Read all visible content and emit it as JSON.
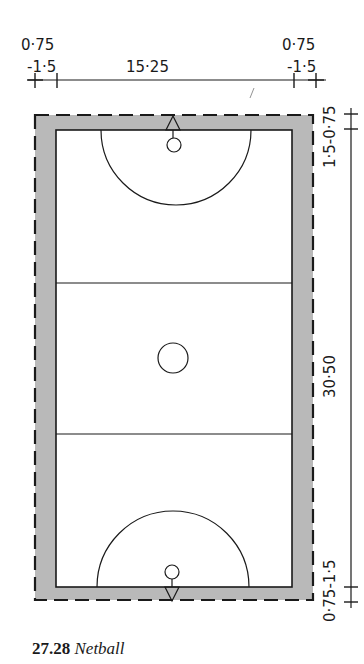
{
  "figure": {
    "number": "27.28",
    "title": "Netball",
    "sport": "Netball court plan"
  },
  "dimensions": {
    "top_left_outer": "0·75",
    "top_left_inner": "-1·5",
    "court_width": "15·25",
    "top_right_outer": "0·75",
    "top_right_inner": "-1·5",
    "end_margin_top": "1·5-0·75",
    "court_length": "30·50",
    "end_margin_bottom": "0·75-1·5"
  },
  "colors": {
    "line": "#1a1a1a",
    "runoff_fill": "#b9b9b9",
    "court_fill": "#ffffff",
    "background": "#ffffff"
  },
  "court": {
    "zones": [
      "goal-third-top",
      "centre-third",
      "goal-third-bottom"
    ],
    "features": [
      "shooting-circle-top",
      "centre-circle",
      "shooting-circle-bottom",
      "goal-post-top",
      "goal-post-bottom"
    ]
  }
}
